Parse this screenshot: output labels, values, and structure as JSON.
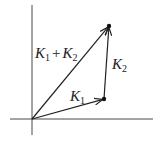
{
  "diagram": {
    "type": "vector-addition",
    "colors": {
      "stroke": "#222222",
      "background": "#ffffff"
    },
    "axes": {
      "x_axis": {
        "from": [
          10,
          119
        ],
        "to": [
          153,
          119
        ]
      },
      "y_axis": {
        "from": [
          32,
          5
        ],
        "to": [
          32,
          135
        ]
      }
    },
    "origin": [
      32,
      119
    ],
    "points": {
      "K1_tip": [
        104,
        99
      ],
      "sum_tip": [
        109,
        26
      ]
    },
    "vectors": [
      {
        "name": "K1",
        "from": [
          32,
          119
        ],
        "to": [
          104,
          99
        ]
      },
      {
        "name": "K2",
        "from": [
          104,
          99
        ],
        "to": [
          109,
          26
        ]
      },
      {
        "name": "K1 + K2",
        "from": [
          32,
          119
        ],
        "to": [
          109,
          26
        ]
      }
    ],
    "labels": {
      "sum": {
        "k1": "K",
        "sub1": "1",
        "plus": "+",
        "k2": "K",
        "sub2": "2"
      },
      "k2": {
        "k": "K",
        "sub": "2"
      },
      "k1": {
        "k": "K",
        "sub": "1"
      }
    }
  }
}
